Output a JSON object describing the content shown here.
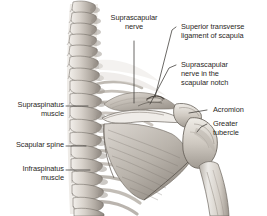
{
  "figure": {
    "view": "posterior view of right shoulder and cervicothoracic spine",
    "style": "grayscale anatomical illustration",
    "width": 267,
    "height": 216,
    "background_color": "#ffffff",
    "label_color": "#2a2724",
    "leader_color": "#3a3733"
  },
  "labels": {
    "suprascapular_nerve": "Suprascapular\nnerve",
    "superior_transverse_ligament": "Superior transverse\nligament of scapula",
    "nerve_in_notch": "Suprascapular\nnerve in the\nscapular notch",
    "acromion": "Acromion",
    "greater_tubercle": "Greater\ntubercle",
    "supraspinatus_muscle": "Supraspinatus\nmuscle",
    "scapular_spine": "Scapular spine",
    "infraspinatus_muscle": "Infraspinatus\nmuscle"
  },
  "structures": {
    "vertebral_column": "cervical and thoracic vertebrae",
    "scapula": "right scapula",
    "humerus": "right humerus shaft",
    "ribs": "posterior rib cage"
  },
  "palette": {
    "bone_light": "#e8e4df",
    "bone_mid": "#c7c1b9",
    "bone_shadow": "#9b948c",
    "muscle_light": "#dcd7d1",
    "muscle_mid": "#b8b2aa",
    "muscle_dark": "#8d867e",
    "outline": "#6e6862"
  }
}
